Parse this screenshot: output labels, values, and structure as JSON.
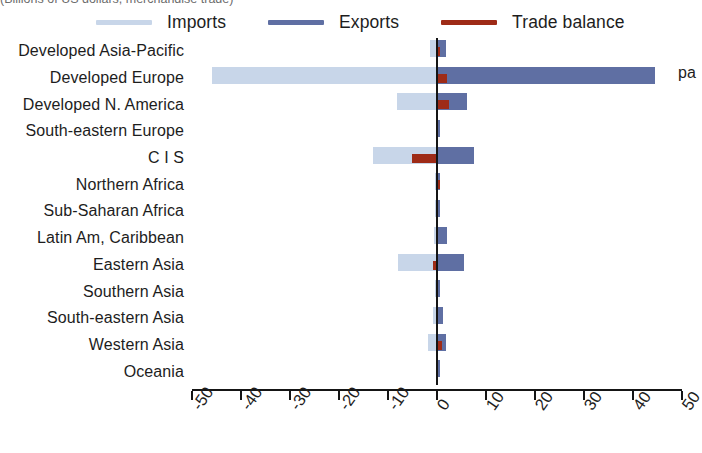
{
  "figure": {
    "top_caption_clipped": "(Billions of US dollars, merchandise trade)",
    "right_margin_clipped": "pa"
  },
  "legend": {
    "position": "top",
    "items": [
      {
        "label": "Imports",
        "color": "#c8d6e9",
        "name": "imports"
      },
      {
        "label": "Exports",
        "color": "#5f6fa3",
        "name": "exports"
      },
      {
        "label": "Trade balance",
        "color": "#9e2b17",
        "name": "trade-balance"
      }
    ]
  },
  "axis": {
    "ticks": [
      "-50",
      "-40",
      "-30",
      "-20",
      "-10",
      "0",
      "10",
      "20",
      "30",
      "40",
      "50"
    ],
    "min": -50,
    "max": 50,
    "zero_label": "0"
  },
  "chart_data": {
    "type": "bar",
    "orientation": "horizontal",
    "title": "",
    "subtitle": "",
    "xlabel": "",
    "ylabel": "",
    "xlim": [
      -50,
      50
    ],
    "grid": false,
    "legend_position": "top",
    "categories": [
      "Developed Asia-Pacific",
      "Developed Europe",
      "Developed N. America",
      "South-eastern Europe",
      "C I S",
      "Northern Africa",
      "Sub-Saharan Africa",
      "Latin Am, Caribbean",
      "Eastern Asia",
      "Southern Asia",
      "South-eastern Asia",
      "Western Asia",
      "Oceania"
    ],
    "series": [
      {
        "name": "Imports",
        "color": "#c8d6e9",
        "values": [
          -1.4,
          -46.0,
          -8.2,
          -0.2,
          -13.0,
          -0.5,
          -0.4,
          -0.6,
          -8.0,
          -0.4,
          -0.9,
          -1.8,
          -0.1
        ]
      },
      {
        "name": "Exports",
        "color": "#5f6fa3",
        "values": [
          1.8,
          44.5,
          6.2,
          0.3,
          7.6,
          0.6,
          0.5,
          2.0,
          5.6,
          0.6,
          1.2,
          1.9,
          0.1
        ]
      },
      {
        "name": "Trade balance",
        "color": "#9e2b17",
        "values": [
          0.7,
          2.0,
          2.4,
          0.0,
          -5.2,
          0.6,
          0.0,
          0.0,
          -0.9,
          0.0,
          0.0,
          1.0,
          0.0
        ]
      }
    ]
  }
}
